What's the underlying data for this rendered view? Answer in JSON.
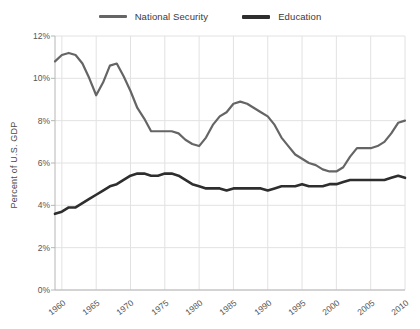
{
  "chart_data": {
    "type": "line",
    "title": "",
    "xlabel": "",
    "ylabel": "Percent of U.S. GDP",
    "xlim": [
      1959,
      2010
    ],
    "ylim": [
      0,
      12
    ],
    "grid": true,
    "legend_position": "top-center",
    "x_tick_labels": [
      "1960",
      "1965",
      "1970",
      "1975",
      "1980",
      "1985",
      "1990",
      "1995",
      "2000",
      "2005",
      "2010"
    ],
    "x_ticks": [
      1960,
      1965,
      1970,
      1975,
      1980,
      1985,
      1990,
      1995,
      2000,
      2005,
      2010
    ],
    "y_tick_labels": [
      "0%",
      "2%",
      "4%",
      "6%",
      "8%",
      "10%",
      "12%"
    ],
    "y_ticks": [
      0,
      2,
      4,
      6,
      8,
      10,
      12
    ],
    "x": [
      1959,
      1960,
      1961,
      1962,
      1963,
      1964,
      1965,
      1966,
      1967,
      1968,
      1969,
      1970,
      1971,
      1972,
      1973,
      1974,
      1975,
      1976,
      1977,
      1978,
      1979,
      1980,
      1981,
      1982,
      1983,
      1984,
      1985,
      1986,
      1987,
      1988,
      1989,
      1990,
      1991,
      1992,
      1993,
      1994,
      1995,
      1996,
      1997,
      1998,
      1999,
      2000,
      2001,
      2002,
      2003,
      2004,
      2005,
      2006,
      2007,
      2008,
      2009,
      2010
    ],
    "series": [
      {
        "name": "National Security",
        "color": "#656565",
        "width": 2.2,
        "values": [
          10.8,
          11.1,
          11.2,
          11.1,
          10.7,
          10.0,
          9.2,
          9.8,
          10.6,
          10.7,
          10.1,
          9.4,
          8.6,
          8.1,
          7.5,
          7.5,
          7.5,
          7.5,
          7.4,
          7.1,
          6.9,
          6.8,
          7.2,
          7.8,
          8.2,
          8.4,
          8.8,
          8.9,
          8.8,
          8.6,
          8.4,
          8.2,
          7.8,
          7.2,
          6.8,
          6.4,
          6.2,
          6.0,
          5.9,
          5.7,
          5.6,
          5.6,
          5.8,
          6.3,
          6.7,
          6.7,
          6.7,
          6.8,
          7.0,
          7.4,
          7.9,
          8.0
        ]
      },
      {
        "name": "Education",
        "color": "#2e2e2e",
        "width": 2.6,
        "values": [
          3.6,
          3.7,
          3.9,
          3.9,
          4.1,
          4.3,
          4.5,
          4.7,
          4.9,
          5.0,
          5.2,
          5.4,
          5.5,
          5.5,
          5.4,
          5.4,
          5.5,
          5.5,
          5.4,
          5.2,
          5.0,
          4.9,
          4.8,
          4.8,
          4.8,
          4.7,
          4.8,
          4.8,
          4.8,
          4.8,
          4.8,
          4.7,
          4.8,
          4.9,
          4.9,
          4.9,
          5.0,
          4.9,
          4.9,
          4.9,
          5.0,
          5.0,
          5.1,
          5.2,
          5.2,
          5.2,
          5.2,
          5.2,
          5.2,
          5.3,
          5.4,
          5.3
        ]
      }
    ]
  },
  "legend": {
    "items": [
      {
        "label": "National Security",
        "swatch": "line-swatch-national-security"
      },
      {
        "label": "Education",
        "swatch": "line-swatch-education"
      }
    ]
  },
  "axes": {
    "y_title": "Percent of U.S. GDP"
  },
  "colors": {
    "background": "#ffffff",
    "grid": "#e2e2e2",
    "axis": "#b6b6b6",
    "tick_text": "#555555",
    "national_security": "#656565",
    "education": "#2e2e2e"
  }
}
